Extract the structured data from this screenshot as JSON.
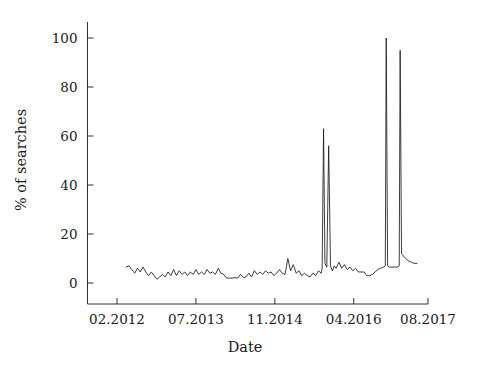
{
  "chart_data": {
    "type": "line",
    "title": "",
    "subtitle": "",
    "xlabel": "Date",
    "ylabel": "% of searches",
    "grid": false,
    "legend": null,
    "legend_position": "none",
    "line_color": "#1a1a1a",
    "background_color": "#ffffff",
    "axis_color": "#1a1a1a",
    "x_tick_labels": [
      "02.2012",
      "07.2013",
      "11.2014",
      "04.2016",
      "08.2017"
    ],
    "x_tick_values": [
      0,
      17,
      34,
      51,
      67
    ],
    "xlim": [
      -4,
      72
    ],
    "y_tick_labels": [
      "0",
      "20",
      "40",
      "60",
      "80",
      "100"
    ],
    "y_tick_values": [
      0,
      20,
      40,
      60,
      80,
      100
    ],
    "ylim": [
      -4,
      112
    ],
    "annotations": [
      {
        "text": "peak 1",
        "x": 44.5,
        "y": 63
      },
      {
        "text": "peak 2",
        "x": 46.0,
        "y": 56
      },
      {
        "text": "peak 3",
        "x": 58.0,
        "y": 100
      },
      {
        "text": "peak 4",
        "x": 61.0,
        "y": 95
      }
    ],
    "x": [
      2.0,
      2.6,
      3.2,
      3.8,
      4.4,
      5.0,
      5.6,
      6.2,
      6.8,
      7.4,
      8.0,
      8.6,
      9.2,
      9.8,
      10.4,
      11.0,
      11.6,
      12.2,
      12.8,
      13.4,
      14.0,
      14.6,
      15.2,
      15.8,
      16.4,
      17.0,
      17.6,
      18.2,
      18.8,
      19.4,
      20.0,
      20.6,
      21.2,
      21.8,
      22.4,
      23.0,
      23.6,
      24.2,
      24.8,
      25.4,
      26.0,
      26.6,
      27.2,
      27.8,
      28.4,
      29.0,
      29.6,
      30.2,
      30.8,
      31.4,
      32.0,
      32.6,
      33.2,
      33.8,
      34.4,
      35.0,
      35.6,
      36.2,
      36.8,
      37.4,
      38.0,
      38.6,
      39.2,
      39.8,
      40.4,
      41.0,
      41.6,
      42.2,
      42.8,
      43.4,
      44.0,
      44.2,
      44.5,
      44.8,
      45.2,
      45.6,
      46.0,
      46.4,
      46.8,
      47.2,
      47.8,
      48.4,
      49.0,
      49.6,
      50.2,
      50.8,
      51.4,
      52.0,
      52.6,
      53.2,
      53.8,
      54.4,
      55.0,
      55.6,
      56.2,
      56.8,
      57.4,
      57.8,
      58.0,
      58.3,
      58.7,
      59.2,
      59.8,
      60.4,
      60.8,
      61.0,
      61.3,
      61.7,
      62.2,
      62.8,
      63.4,
      64.0,
      64.6
    ],
    "y": [
      6.5,
      7.0,
      5.5,
      4.0,
      6.0,
      4.5,
      6.5,
      4.5,
      3.0,
      4.5,
      3.0,
      1.5,
      2.5,
      3.5,
      2.5,
      4.5,
      3.0,
      5.5,
      3.0,
      5.0,
      3.5,
      4.5,
      3.0,
      4.5,
      3.5,
      5.5,
      3.5,
      4.5,
      3.5,
      5.5,
      4.0,
      4.5,
      3.5,
      6.0,
      4.0,
      3.5,
      2.0,
      2.0,
      2.0,
      2.2,
      2.0,
      3.5,
      2.2,
      2.5,
      4.0,
      2.5,
      5.0,
      3.5,
      4.5,
      3.5,
      5.0,
      4.0,
      4.5,
      3.0,
      4.0,
      5.5,
      4.0,
      3.5,
      10.0,
      5.0,
      7.5,
      4.0,
      5.0,
      3.0,
      4.0,
      3.0,
      2.5,
      4.0,
      3.0,
      5.0,
      4.0,
      6.0,
      63.0,
      8.0,
      6.5,
      56.0,
      7.0,
      5.0,
      7.0,
      6.0,
      8.5,
      6.0,
      7.5,
      5.5,
      6.5,
      5.0,
      6.0,
      4.5,
      4.5,
      4.5,
      3.0,
      3.0,
      3.5,
      4.5,
      5.5,
      6.0,
      6.5,
      7.0,
      100.0,
      7.0,
      6.5,
      6.5,
      6.5,
      6.5,
      7.0,
      95.0,
      12.0,
      11.0,
      10.0,
      9.0,
      8.5,
      8.0,
      8.0
    ]
  },
  "figure": {
    "width": 480,
    "height": 373
  }
}
